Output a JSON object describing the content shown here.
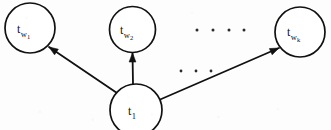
{
  "figure": {
    "background_color": "#fdfdfd",
    "stroke_color": "#111111",
    "width": 331,
    "height": 130
  },
  "nodes": [
    {
      "id": "tw1",
      "name": "node-tw1",
      "base": "t",
      "sub1": "w",
      "sub2": "1",
      "cx": 30,
      "cy": 28,
      "r": 25,
      "label_x": 17,
      "label_y": 20
    },
    {
      "id": "tw2",
      "name": "node-tw2",
      "base": "t",
      "sub1": "w",
      "sub2": "2",
      "cx": 132.5,
      "cy": 29.5,
      "r": 23,
      "label_x": 120,
      "label_y": 21
    },
    {
      "id": "twk",
      "name": "node-twk",
      "base": "t",
      "sub1": "w",
      "sub2": "k",
      "cx": 300,
      "cy": 32,
      "r": 25,
      "label_x": 287,
      "label_y": 23
    },
    {
      "id": "t1",
      "name": "node-t1",
      "base": "t",
      "sub1": "1",
      "sub2": "",
      "cx": 136,
      "cy": 110,
      "r": 26,
      "label_x": 128,
      "label_y": 102
    }
  ],
  "edges": [
    {
      "id": "edge-t1-to-tw1",
      "name": "edge-t1-to-tw1",
      "from": "t1",
      "to": "tw1",
      "x1": 117,
      "y1": 93,
      "x2": 49,
      "y2": 47,
      "arrow_angle_deg": 214
    },
    {
      "id": "edge-t1-to-tw2",
      "name": "edge-t1-to-tw2",
      "from": "t1",
      "to": "tw2",
      "x1": 133,
      "y1": 84,
      "x2": 132.5,
      "y2": 53,
      "arrow_angle_deg": 270
    },
    {
      "id": "edge-t1-to-twk",
      "name": "edge-t1-to-twk",
      "from": "t1",
      "to": "twk",
      "x1": 159,
      "y1": 100,
      "x2": 279,
      "y2": 48,
      "arrow_angle_deg": 336
    }
  ],
  "ellipses": [
    {
      "id": "ellipsis-upper",
      "name": "ellipsis-upper",
      "y": 30,
      "dot_radius": 1.5,
      "dots_x": [
        197,
        213,
        229,
        244
      ]
    },
    {
      "id": "ellipsis-lower",
      "name": "ellipsis-lower",
      "y": 71,
      "dot_radius": 1.4,
      "dots_x": [
        181,
        196,
        211
      ]
    }
  ]
}
